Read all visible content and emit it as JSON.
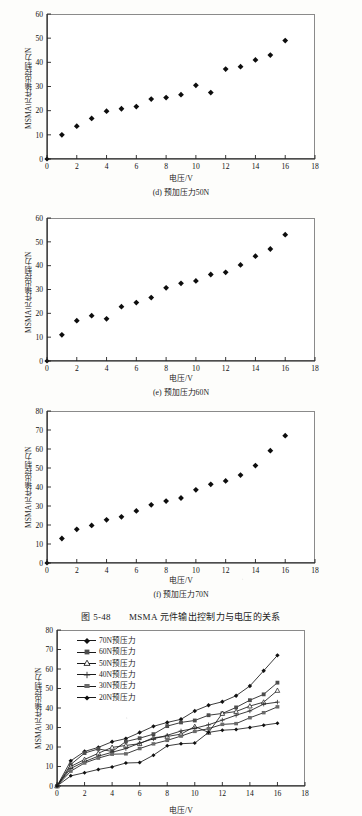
{
  "figure": {
    "caption_number": "图 5-48",
    "caption_title": "MSMA 元件输出控制力与电压的关系"
  },
  "axis_titles": {
    "y": "MSMA元件输出控制力/N",
    "x": "电压/V"
  },
  "chart_data": [
    {
      "type": "scatter",
      "panel": "(d)",
      "title": "(d) 预加压力50N",
      "xlabel": "电压/V",
      "ylabel": "MSMA元件输出控制力/N",
      "xlim": [
        0,
        18
      ],
      "ylim": [
        0,
        60
      ],
      "xticks": [
        0,
        2,
        4,
        6,
        8,
        10,
        12,
        14,
        16,
        18
      ],
      "yticks": [
        0,
        10,
        20,
        30,
        40,
        50,
        60
      ],
      "grid": false,
      "legend": null,
      "marker": "filled-diamond",
      "x": [
        0,
        1,
        2,
        3,
        4,
        5,
        6,
        7,
        8,
        9,
        10,
        11,
        12,
        13,
        14,
        15,
        16
      ],
      "values": [
        0,
        10.0,
        13.6,
        16.8,
        19.8,
        20.8,
        21.7,
        24.8,
        25.4,
        26.6,
        30.5,
        27.5,
        37.2,
        38.2,
        41.0,
        43.0,
        49.0
      ]
    },
    {
      "type": "scatter",
      "panel": "(e)",
      "title": "(e) 预加压力60N",
      "xlabel": "电压/V",
      "ylabel": "MSMA元件输出控制力/N",
      "xlim": [
        0,
        18
      ],
      "ylim": [
        0,
        60
      ],
      "xticks": [
        0,
        2,
        4,
        6,
        8,
        10,
        12,
        14,
        16,
        18
      ],
      "yticks": [
        0,
        10,
        20,
        30,
        40,
        50,
        60
      ],
      "grid": false,
      "legend": null,
      "marker": "filled-diamond",
      "x": [
        0,
        1,
        2,
        3,
        4,
        5,
        6,
        7,
        8,
        9,
        10,
        11,
        12,
        13,
        14,
        15,
        16
      ],
      "values": [
        0,
        11.0,
        16.9,
        19.0,
        17.7,
        22.8,
        24.5,
        26.6,
        30.7,
        32.6,
        33.6,
        36.3,
        37.2,
        40.3,
        44.0,
        47.0,
        53.0
      ]
    },
    {
      "type": "scatter",
      "panel": "(f)",
      "title": "(f) 预加压力70N",
      "xlabel": "电压/V",
      "ylabel": "MSMA元件输出控制力/N",
      "xlim": [
        0,
        18
      ],
      "ylim": [
        0,
        80
      ],
      "xticks": [
        0,
        2,
        4,
        6,
        8,
        10,
        12,
        14,
        16,
        18
      ],
      "yticks": [
        0,
        10,
        20,
        30,
        40,
        50,
        60,
        70,
        80
      ],
      "grid": false,
      "legend": null,
      "marker": "filled-diamond",
      "x": [
        0,
        1,
        2,
        3,
        4,
        5,
        6,
        7,
        8,
        9,
        10,
        11,
        12,
        13,
        14,
        15,
        16
      ],
      "values": [
        0,
        12.9,
        17.7,
        19.8,
        22.7,
        24.3,
        27.4,
        30.6,
        32.6,
        34.2,
        38.5,
        41.4,
        43.2,
        46.3,
        51.3,
        59.1,
        67.0
      ]
    },
    {
      "type": "line",
      "panel": "combined",
      "title": "",
      "xlabel": "电压/V",
      "ylabel": "MSMA元件输出控制力/N",
      "xlim": [
        0,
        18
      ],
      "ylim": [
        0,
        80
      ],
      "xticks": [
        0,
        2,
        4,
        6,
        8,
        10,
        12,
        14,
        16,
        18
      ],
      "yticks": [
        0,
        10,
        20,
        30,
        40,
        50,
        60,
        70,
        80
      ],
      "grid": false,
      "legend_position": "upper-left",
      "x": [
        0,
        1,
        2,
        3,
        4,
        5,
        6,
        7,
        8,
        9,
        10,
        11,
        12,
        13,
        14,
        15,
        16
      ],
      "series": [
        {
          "name": "70N预压力",
          "marker": "filled-diamond",
          "values": [
            0,
            12.9,
            17.7,
            19.8,
            22.7,
            24.3,
            27.4,
            30.6,
            32.6,
            34.2,
            38.5,
            41.4,
            43.2,
            46.3,
            51.3,
            59.1,
            67.0
          ]
        },
        {
          "name": "60N预压力",
          "marker": "filled-square",
          "values": [
            0,
            11.0,
            16.9,
            19.0,
            17.7,
            22.8,
            24.5,
            26.6,
            30.7,
            32.6,
            33.6,
            36.3,
            37.2,
            40.3,
            44.0,
            47.0,
            53.0
          ]
        },
        {
          "name": "50N预压力",
          "marker": "open-triangle",
          "values": [
            0,
            10.0,
            13.6,
            16.8,
            19.8,
            20.8,
            21.7,
            24.8,
            25.4,
            26.6,
            30.5,
            27.5,
            37.2,
            38.2,
            41.0,
            43.0,
            49.0
          ]
        },
        {
          "name": "40N预压力",
          "marker": "plus-star",
          "values": [
            0,
            9.0,
            12.5,
            15.3,
            17.3,
            19.2,
            22.0,
            24.2,
            26.0,
            28.2,
            29.6,
            31.4,
            33.8,
            36.3,
            38.5,
            42.0,
            43.0
          ]
        },
        {
          "name": "30N预压力",
          "marker": "filled-square-gray",
          "values": [
            0,
            7.6,
            11.8,
            14.3,
            16.3,
            16.5,
            19.2,
            21.6,
            23.4,
            25.6,
            28.0,
            29.4,
            31.6,
            32.0,
            35.0,
            37.6,
            40.6
          ]
        },
        {
          "name": "20N预压力",
          "marker": "filled-diamond-small",
          "values": [
            0,
            5.2,
            6.8,
            8.5,
            9.8,
            11.8,
            12.0,
            15.8,
            20.6,
            21.7,
            22.0,
            27.5,
            28.6,
            29.0,
            30.0,
            31.2,
            32.2
          ]
        }
      ]
    }
  ]
}
